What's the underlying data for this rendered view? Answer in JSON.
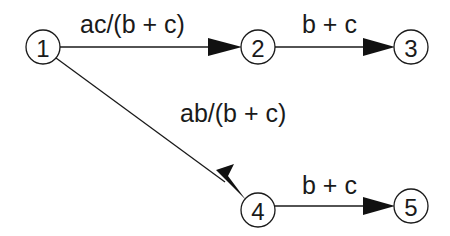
{
  "diagram": {
    "nodes": [
      {
        "id": "1",
        "label": "1",
        "cx": 43,
        "cy": 47
      },
      {
        "id": "2",
        "label": "2",
        "cx": 258,
        "cy": 47
      },
      {
        "id": "3",
        "label": "3",
        "cx": 411,
        "cy": 47
      },
      {
        "id": "4",
        "label": "4",
        "cx": 258,
        "cy": 212
      },
      {
        "id": "5",
        "label": "5",
        "cx": 411,
        "cy": 212
      }
    ],
    "edges": [
      {
        "from": "1",
        "to": "2",
        "label": "ac/(b + c)"
      },
      {
        "from": "2",
        "to": "3",
        "label": "b + c"
      },
      {
        "from": "1",
        "to": "4",
        "label": "ab/(b + c)"
      },
      {
        "from": "4",
        "to": "5",
        "label": "b + c"
      }
    ]
  }
}
